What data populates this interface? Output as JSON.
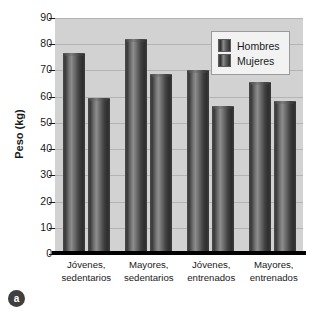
{
  "chart_data": {
    "type": "bar",
    "title": "",
    "subtitle": "",
    "xlabel": "",
    "ylabel": "Peso (kg)",
    "ylim": [
      0,
      90
    ],
    "ytick_step": 10,
    "yticks": [
      "90",
      "80",
      "70",
      "60",
      "50",
      "40",
      "30",
      "20",
      "10",
      "0"
    ],
    "grid": true,
    "legend_position": "top-right",
    "categories": [
      "Jóvenes,\nsedentarios",
      "Mayores,\nsedentarios",
      "Jóvenes,\nentrenados",
      "Mayores,\nentrenados"
    ],
    "category_lines": [
      [
        "Jóvenes,",
        "sedentarios"
      ],
      [
        "Mayores,",
        "sedentarios"
      ],
      [
        "Jóvenes,",
        "entrenados"
      ],
      [
        "Mayores,",
        "entrenados"
      ]
    ],
    "series": [
      {
        "name": "Hombres",
        "values": [
          76.5,
          82.0,
          70.0,
          65.5
        ]
      },
      {
        "name": "Mujeres",
        "values": [
          59.5,
          68.5,
          56.5,
          58.5
        ]
      }
    ]
  },
  "legend": {
    "entries": [
      {
        "label": "Hombres"
      },
      {
        "label": "Mujeres"
      }
    ]
  },
  "panel": {
    "marker": "a"
  },
  "colors": {
    "plot_background": "#d2d2d2",
    "gridline": "#b4b4b4",
    "bar_dark": "#2e2e2e",
    "bar_highlight": "#8d8d8d",
    "axis": "#000000",
    "text": "#1a1a1a",
    "legend_background": "#f2f2f2"
  }
}
